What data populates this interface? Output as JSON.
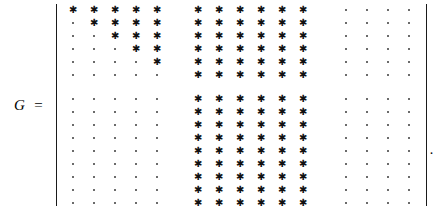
{
  "expression": {
    "variable": "G",
    "relation": "=",
    "trailing_punctuation": "."
  },
  "matrix": {
    "rows": 15,
    "cols": 15,
    "star_glyph": "✱",
    "dot_glyph": "·",
    "bracket_style": "vertical-bar",
    "row_block_sizes": [
      6,
      9
    ],
    "col_block_sizes": [
      5,
      6,
      4
    ],
    "colors": {
      "star": "#111111",
      "dot": "#3a3a3a",
      "bracket": "#1a1a1a",
      "background": "#ffffff"
    },
    "cells": [
      [
        "*",
        "*",
        "*",
        "*",
        "*",
        "*",
        "*",
        "*",
        "*",
        "*",
        "*",
        ".",
        ".",
        ".",
        "."
      ],
      [
        ".",
        "*",
        "*",
        "*",
        "*",
        "*",
        "*",
        "*",
        "*",
        "*",
        "*",
        ".",
        ".",
        ".",
        "."
      ],
      [
        ".",
        ".",
        "*",
        "*",
        "*",
        "*",
        "*",
        "*",
        "*",
        "*",
        "*",
        ".",
        ".",
        ".",
        "."
      ],
      [
        ".",
        ".",
        ".",
        "*",
        "*",
        "*",
        "*",
        "*",
        "*",
        "*",
        "*",
        ".",
        ".",
        ".",
        "."
      ],
      [
        ".",
        ".",
        ".",
        ".",
        "*",
        "*",
        "*",
        "*",
        "*",
        "*",
        "*",
        ".",
        ".",
        ".",
        "."
      ],
      [
        ".",
        ".",
        ".",
        ".",
        ".",
        "*",
        "*",
        "*",
        "*",
        "*",
        "*",
        ".",
        ".",
        ".",
        "."
      ],
      [
        ".",
        ".",
        ".",
        ".",
        ".",
        "*",
        "*",
        "*",
        "*",
        "*",
        "*",
        ".",
        ".",
        ".",
        "."
      ],
      [
        ".",
        ".",
        ".",
        ".",
        ".",
        "*",
        "*",
        "*",
        "*",
        "*",
        "*",
        ".",
        ".",
        ".",
        "."
      ],
      [
        ".",
        ".",
        ".",
        ".",
        ".",
        "*",
        "*",
        "*",
        "*",
        "*",
        "*",
        ".",
        ".",
        ".",
        "."
      ],
      [
        ".",
        ".",
        ".",
        ".",
        ".",
        "*",
        "*",
        "*",
        "*",
        "*",
        "*",
        ".",
        ".",
        ".",
        "."
      ],
      [
        ".",
        ".",
        ".",
        ".",
        ".",
        "*",
        "*",
        "*",
        "*",
        "*",
        "*",
        ".",
        ".",
        ".",
        "."
      ],
      [
        ".",
        ".",
        ".",
        ".",
        ".",
        "*",
        "*",
        "*",
        "*",
        "*",
        "*",
        ".",
        ".",
        ".",
        "."
      ],
      [
        ".",
        ".",
        ".",
        ".",
        ".",
        "*",
        "*",
        "*",
        "*",
        "*",
        "*",
        ".",
        ".",
        ".",
        "."
      ],
      [
        ".",
        ".",
        ".",
        ".",
        ".",
        "*",
        "*",
        "*",
        "*",
        "*",
        "*",
        ".",
        ".",
        ".",
        "."
      ],
      [
        ".",
        ".",
        ".",
        ".",
        ".",
        "*",
        "*",
        "*",
        "*",
        "*",
        "*",
        ".",
        ".",
        ".",
        "."
      ]
    ]
  }
}
